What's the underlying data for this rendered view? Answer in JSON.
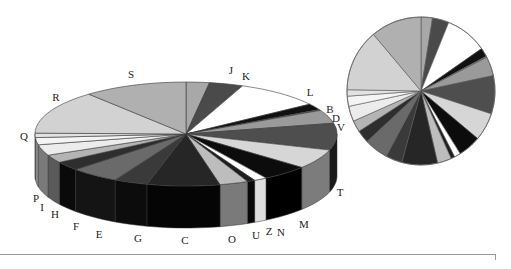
{
  "chart_data": [
    {
      "type": "pie",
      "variant": "3d-exploded-perspective",
      "title": "",
      "start_angle_deg": 0,
      "direction": "clockwise",
      "categories": [
        "J",
        "K",
        "L",
        "B",
        "D",
        "V",
        "T",
        "M",
        "N",
        "Z",
        "U",
        "O",
        "C",
        "G",
        "E",
        "F",
        "H",
        "I",
        "P",
        "Q",
        "R",
        "S"
      ],
      "values": [
        9,
        13,
        33,
        7,
        1,
        15,
        30,
        22,
        18,
        5,
        3,
        11,
        28,
        13,
        19,
        10,
        9,
        12,
        8,
        5,
        49,
        40
      ],
      "colors": [
        "#a8a8a8",
        "#4a4a4a",
        "#ffffff",
        "#111111",
        "#777777",
        "#9a9a9a",
        "#4e4e4e",
        "#d6d6d6",
        "#0c0c0c",
        "#ffffff",
        "#1e1e1e",
        "#bdbdbd",
        "#262626",
        "#3a3a3a",
        "#6a6a6a",
        "#2e2e2e",
        "#b4b4b4",
        "#ececec",
        "#f4f4f4",
        "#e2e2e2",
        "#d2d2d2",
        "#b0b0b0"
      ],
      "side_colors": [
        "#8a8a8a",
        "#2a2a2a",
        "#dcdcdc",
        "#000000",
        "#555555",
        "#707070",
        "#1a1a1a",
        "#7c7c7c",
        "#000000",
        "#dddddd",
        "#080808",
        "#7a7a7a",
        "#050505",
        "#0c0c0c",
        "#141414",
        "#0a0a0a",
        "#5a5a5a",
        "#7a7a7a",
        "#8a8a8a",
        "#8e8e8e",
        "#9a9a9a",
        "#8a8a8a"
      ],
      "legend": "none",
      "labels_on_slices": true
    },
    {
      "type": "pie",
      "variant": "flat-2d",
      "title": "",
      "start_angle_deg": 0,
      "direction": "clockwise",
      "categories": [
        "J",
        "K",
        "L",
        "B",
        "D",
        "V",
        "T",
        "M",
        "N",
        "Z",
        "U",
        "O",
        "C",
        "G",
        "E",
        "F",
        "H",
        "I",
        "P",
        "Q",
        "R",
        "S"
      ],
      "values": [
        9,
        13,
        33,
        7,
        1,
        15,
        30,
        22,
        18,
        5,
        3,
        11,
        28,
        13,
        19,
        10,
        9,
        12,
        8,
        5,
        49,
        40
      ],
      "legend": "none",
      "labels_on_slices": false
    }
  ],
  "big_pie": {
    "cx": 186,
    "cy": 134,
    "rx": 151,
    "ry": 52,
    "depth": 42
  },
  "small_pie": {
    "cx": 421,
    "cy": 91,
    "r": 74
  },
  "label_positions": {
    "J": [
      231,
      74
    ],
    "K": [
      246,
      80
    ],
    "L": [
      310,
      96
    ],
    "B": [
      330,
      113
    ],
    "D": [
      336,
      122
    ],
    "V": [
      341,
      131
    ],
    "T": [
      340,
      196
    ],
    "M": [
      304,
      228
    ],
    "N": [
      281,
      236
    ],
    "Z": [
      269,
      235
    ],
    "U": [
      256,
      239
    ],
    "O": [
      232,
      243
    ],
    "C": [
      185,
      244
    ],
    "G": [
      138,
      242
    ],
    "E": [
      99,
      238
    ],
    "F": [
      76,
      230
    ],
    "H": [
      55,
      218
    ],
    "I": [
      42,
      211
    ],
    "P": [
      36,
      202
    ],
    "Q": [
      24,
      140
    ],
    "R": [
      56,
      101
    ],
    "S": [
      131,
      78
    ]
  }
}
